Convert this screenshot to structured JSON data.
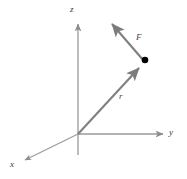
{
  "figure": {
    "background_color": "#ffffff"
  },
  "colors": {
    "axis": "#9a9a9a",
    "vector": "#808080",
    "point": "#000000",
    "label_text": "#3a3a3a"
  },
  "axes": [
    {
      "name": "z-axis",
      "label": "z",
      "label_position": {
        "x": 74,
        "y": 9
      },
      "from": {
        "x": 78,
        "y": 155
      },
      "to": {
        "x": 78,
        "y": 22
      },
      "arrow": true
    },
    {
      "name": "y-axis",
      "label": "y",
      "label_position": {
        "x": 172,
        "y": 133
      },
      "from": {
        "x": 78,
        "y": 134
      },
      "to": {
        "x": 165,
        "y": 134
      },
      "arrow": true
    },
    {
      "name": "x-axis",
      "label": "x",
      "label_position": {
        "x": 14,
        "y": 165
      },
      "from": {
        "x": 78,
        "y": 134
      },
      "to": {
        "x": 23,
        "y": 161
      },
      "arrow": true
    }
  ],
  "origin": {
    "x": 78,
    "y": 134
  },
  "vectors": [
    {
      "name": "position-vector-r",
      "label": "r",
      "label_position": {
        "x": 122,
        "y": 97
      },
      "from": {
        "x": 78,
        "y": 134
      },
      "to": {
        "x": 141,
        "y": 66
      },
      "arrow": true,
      "color": "#808080"
    },
    {
      "name": "force-vector-F",
      "label": "F",
      "label_position": {
        "x": 139,
        "y": 38
      },
      "from": {
        "x": 144,
        "y": 61
      },
      "to": {
        "x": 109,
        "y": 21
      },
      "arrow": true,
      "color": "#808080"
    }
  ],
  "point": {
    "name": "application-point",
    "position": {
      "x": 145,
      "y": 60
    },
    "radius": 3.2,
    "color": "#000000"
  }
}
